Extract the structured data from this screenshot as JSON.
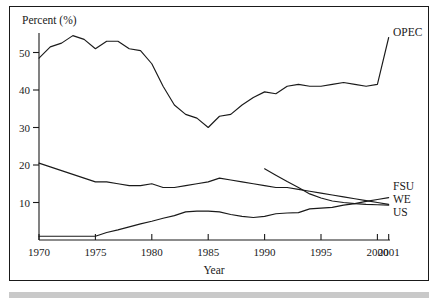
{
  "chart_data": {
    "type": "line",
    "title": "",
    "xlabel": "Year",
    "ylabel": "Percent (%)",
    "xlim": [
      1970,
      2001
    ],
    "ylim": [
      0,
      57
    ],
    "grid": false,
    "legend_position": "right-inline-labels",
    "xticks": [
      1970,
      1975,
      1980,
      1985,
      1990,
      1995,
      2000,
      2001
    ],
    "xticklabels": [
      "1970",
      "1975",
      "1980",
      "1985",
      "1990",
      "1995",
      "2000",
      "2001"
    ],
    "yticks": [
      10,
      20,
      30,
      40,
      50
    ],
    "yticklabels": [
      "10",
      "20",
      "30",
      "40",
      "50"
    ],
    "series": [
      {
        "name": "OPEC",
        "label": "OPEC",
        "x": [
          1970,
          1971,
          1972,
          1973,
          1974,
          1975,
          1976,
          1977,
          1978,
          1979,
          1980,
          1981,
          1982,
          1983,
          1984,
          1985,
          1986,
          1987,
          1988,
          1989,
          1990,
          1991,
          1992,
          1993,
          1994,
          1995,
          1996,
          1997,
          1998,
          1999,
          2000,
          2001
        ],
        "values": [
          48.5,
          51.5,
          52.5,
          54.5,
          53.5,
          51.0,
          53.0,
          53.0,
          51.0,
          50.5,
          47.0,
          41.0,
          36.0,
          33.5,
          32.5,
          30.0,
          33.0,
          33.5,
          36.0,
          38.0,
          39.5,
          39.0,
          41.0,
          41.5,
          41.0,
          41.0,
          41.5,
          42.0,
          41.5,
          41.0,
          41.5,
          54.0
        ]
      },
      {
        "name": "WE",
        "label": "WE",
        "x": [
          1970,
          1971,
          1972,
          1973,
          1974,
          1975,
          1976,
          1977,
          1978,
          1979,
          1980,
          1981,
          1982,
          1983,
          1984,
          1985,
          1986,
          1987,
          1988,
          1989,
          1990,
          1991,
          1992,
          1993,
          1994,
          1995,
          1996,
          1997,
          1998,
          1999,
          2000,
          2001
        ],
        "values": [
          20.5,
          19.5,
          18.5,
          17.5,
          16.5,
          15.5,
          15.5,
          15.0,
          14.5,
          14.5,
          15.0,
          14.0,
          14.0,
          14.5,
          15.0,
          15.5,
          16.5,
          16.0,
          15.5,
          15.0,
          14.5,
          14.0,
          14.0,
          13.5,
          13.0,
          12.5,
          12.0,
          11.5,
          11.0,
          10.5,
          10.0,
          9.5
        ]
      },
      {
        "name": "US",
        "label": "US",
        "x": [
          1970,
          1971,
          1972,
          1973,
          1974,
          1975,
          1976,
          1977,
          1978,
          1979,
          1980,
          1981,
          1982,
          1983,
          1984,
          1985,
          1986,
          1987,
          1988,
          1989,
          1990,
          1991,
          1992,
          1993,
          1994,
          1995,
          1996,
          1997,
          1998,
          1999,
          2000,
          2001
        ],
        "values": [
          1.0,
          1.0,
          1.0,
          1.0,
          1.0,
          1.0,
          2.0,
          2.7,
          3.5,
          4.3,
          5.0,
          5.8,
          6.5,
          7.5,
          7.7,
          7.7,
          7.5,
          6.8,
          6.3,
          6.0,
          6.3,
          7.0,
          7.2,
          7.3,
          8.3,
          8.5,
          8.7,
          9.3,
          9.7,
          10.3,
          10.8,
          11.3
        ]
      },
      {
        "name": "FSU",
        "label": "FSU",
        "x": [
          1990,
          1991,
          1992,
          1993,
          1994,
          1995,
          1996,
          1997,
          1998,
          1999,
          2000,
          2001
        ],
        "values": [
          19.0,
          17.3,
          15.6,
          14.0,
          12.3,
          11.2,
          10.4,
          10.0,
          9.7,
          9.5,
          9.4,
          9.3
        ]
      }
    ]
  },
  "axis": {
    "y_title": "Percent (%)",
    "x_title": "Year"
  },
  "labels": {
    "opec": "OPEC",
    "fsu": "FSU",
    "we": "WE",
    "us": "US"
  },
  "colors": {
    "line": "#1a1a1a",
    "frame": "#1a1a1a",
    "background": "#ffffff",
    "band": "#c9c9c9"
  }
}
